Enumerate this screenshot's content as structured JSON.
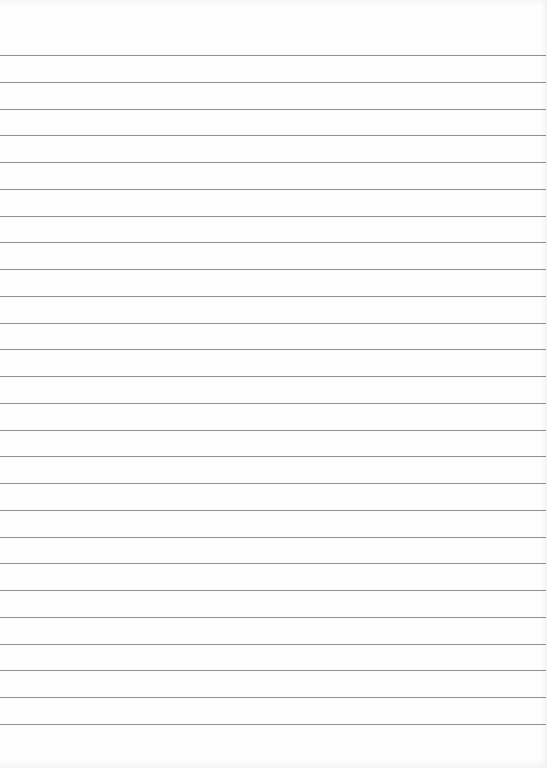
{
  "page": {
    "type": "lined-paper",
    "background_color": "#fdfdfd",
    "line_color": "#8e8e8e",
    "line_count": 26,
    "first_line_y": 55,
    "line_spacing": 26.76
  }
}
